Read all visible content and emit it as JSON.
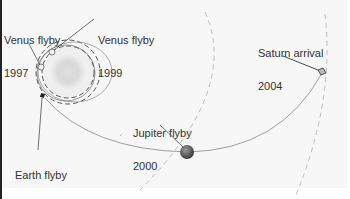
{
  "diagram": {
    "labels": {
      "venus1_line1": "Venus flyby",
      "venus1_line2": "1997",
      "venus2_line1": "Venus flyby",
      "venus2_line2": "1999",
      "earth_line1": "Earth flyby",
      "earth_line2": "1999",
      "jupiter_line1": "Jupiter flyby",
      "jupiter_line2": "2000",
      "saturn_line1": "Saturn arrival",
      "saturn_line2": "2004"
    },
    "colors": {
      "background": "#f7f7f7",
      "trajectory": "#888888",
      "orbit_dashed": "#b0b0b0",
      "sun": "#dcdcdc",
      "jupiter": "#555555",
      "text": "#333333"
    }
  }
}
